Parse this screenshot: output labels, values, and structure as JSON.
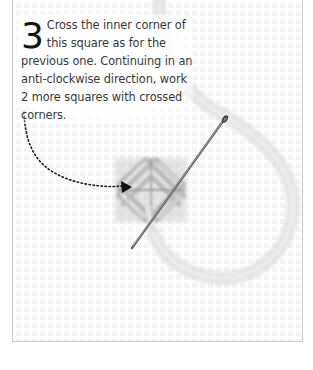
{
  "instruction": {
    "step_number": "3",
    "text": "Cross the inner corner of this square as for the previous one. Continuing in an anti-clockwise direction, work 2 more squares with crossed corners."
  },
  "illustration": {
    "description": "Plastic canvas grid with a partially stitched square of crossed-corner stitches, a threaded needle and a dotted arrow indicating direction",
    "colors": {
      "canvas": "#f4f4f4",
      "grid_holes": "#e6e6e6",
      "yarn": "#d8d8d8",
      "stitch_shadow": "#9a9a9a",
      "needle": "#555555",
      "arrow": "#1a1a1a",
      "text": "#3a3a3a"
    }
  }
}
